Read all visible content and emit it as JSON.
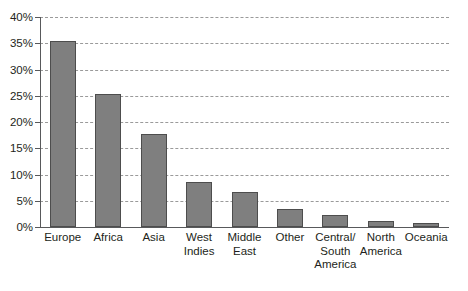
{
  "chart_data": {
    "type": "bar",
    "title": "",
    "subtitle": "",
    "xlabel": "",
    "ylabel": "",
    "categories": [
      "Europe",
      "Africa",
      "Asia",
      "West Indies",
      "Middle East",
      "Other",
      "Central/ South America",
      "North America",
      "Oceania"
    ],
    "category_lines": [
      [
        "Europe"
      ],
      [
        "Africa"
      ],
      [
        "Asia"
      ],
      [
        "West",
        "Indies"
      ],
      [
        "Middle",
        "East"
      ],
      [
        "Other"
      ],
      [
        "Central/",
        "South",
        "America"
      ],
      [
        "North",
        "America"
      ],
      [
        "Oceania"
      ]
    ],
    "values": [
      35.5,
      25.4,
      17.8,
      8.6,
      6.7,
      3.5,
      2.2,
      1.1,
      0.8
    ],
    "value_labels": [
      "35.5%",
      "25.4%",
      "17.8%",
      "8.6%",
      "6.7%",
      "3.5%",
      "2.2%",
      "1.1%",
      "0.8%"
    ],
    "ylim": [
      0,
      40
    ],
    "ytick_values": [
      0,
      5,
      10,
      15,
      20,
      25,
      30,
      35,
      40
    ],
    "ytick_labels": [
      "0%",
      "5%",
      "10%",
      "15%",
      "20%",
      "25%",
      "30%",
      "35%",
      "40%"
    ],
    "grid": true,
    "grid_style": "dashed",
    "legend": false,
    "legend_position": "none",
    "bar_color": "#7f7f7f",
    "bar_border_color": "#4d4d4d",
    "grid_color": "#9a9a9a",
    "axis_color": "#58595b",
    "background_color": "#ffffff",
    "text_color": "#231f20"
  }
}
